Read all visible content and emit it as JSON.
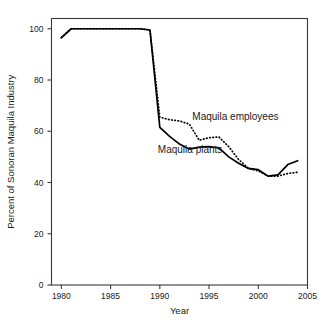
{
  "chart_data": {
    "type": "line",
    "title": "",
    "xlabel": "Year",
    "ylabel": "Percent of Sonoran Maquila Industry",
    "xlim": [
      1979,
      2005
    ],
    "ylim": [
      0,
      104
    ],
    "xticks": [
      1980,
      1985,
      1990,
      1995,
      2000,
      2005
    ],
    "xtick_labels": [
      "1980",
      "1985",
      "1990",
      "1995",
      "2000",
      "2005"
    ],
    "yticks": [
      0,
      20,
      40,
      60,
      80,
      100
    ],
    "ytick_labels": [
      "0",
      "20",
      "40",
      "60",
      "80",
      "100"
    ],
    "grid": false,
    "legend_position": "inline-annotations",
    "x": [
      1980,
      1981,
      1982,
      1983,
      1984,
      1985,
      1986,
      1987,
      1988,
      1989,
      1990,
      1991,
      1992,
      1993,
      1994,
      1995,
      1996,
      1997,
      1998,
      1999,
      2000,
      2001,
      2002,
      2003,
      2004
    ],
    "series": [
      {
        "name": "Maquila plants",
        "style": "solid",
        "color": "#000000",
        "values": [
          96.5,
          100,
          100,
          100,
          100,
          100,
          100,
          100,
          100,
          99.5,
          61.5,
          58,
          55,
          53,
          53.8,
          54,
          53.5,
          50,
          47.5,
          45.5,
          45,
          42.5,
          43,
          47,
          48.5
        ]
      },
      {
        "name": "Maquila employees",
        "style": "dotted",
        "color": "#000000",
        "values": [
          96.5,
          100,
          100,
          100,
          100,
          100,
          100,
          100,
          100,
          99.5,
          65.5,
          64.5,
          64,
          62.8,
          56.5,
          57.5,
          57.8,
          54,
          49,
          45.5,
          44.5,
          42.5,
          42.5,
          43.5,
          44
        ]
      }
    ],
    "annotations": [
      {
        "text": "Maquila employees",
        "x": 1993.3,
        "y": 64.5,
        "series": "Maquila employees"
      },
      {
        "text": "Maquila plants",
        "x": 1989.8,
        "y": 51.5,
        "series": "Maquila plants"
      }
    ]
  }
}
